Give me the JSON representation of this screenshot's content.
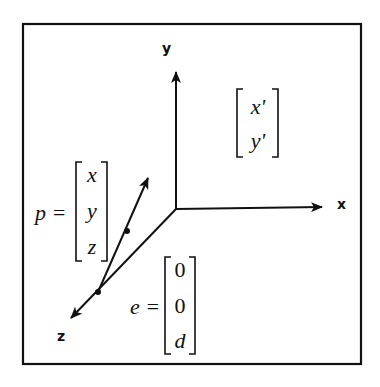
{
  "diagram": {
    "type": "3d-perspective-projection",
    "frame": {
      "stroke": "#111111"
    },
    "axes": {
      "x_label": "x",
      "y_label": "y",
      "z_label": "z"
    },
    "point_vector": {
      "lhs": "p =",
      "entries": [
        "x",
        "y",
        "z"
      ]
    },
    "eye_vector": {
      "lhs": "e =",
      "entries": [
        "0",
        "0",
        "d"
      ]
    },
    "projected_vector": {
      "entries": [
        "x'",
        "y'"
      ]
    },
    "colors": {
      "ink": "#111111",
      "background": "#ffffff"
    }
  }
}
